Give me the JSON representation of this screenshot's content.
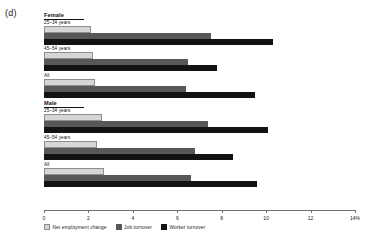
{
  "panel": {
    "letter": "(d)"
  },
  "chart_data": {
    "type": "bar",
    "orientation": "horizontal",
    "title": "",
    "xlabel": "",
    "ylabel": "",
    "xlim": [
      0,
      14
    ],
    "xticks": [
      0,
      2,
      4,
      6,
      8,
      10,
      12,
      14
    ],
    "xtick_labels": [
      "0",
      "2",
      "4",
      "6",
      "8",
      "10",
      "12",
      "14%"
    ],
    "grid": false,
    "legend_position": "bottom-left",
    "series": [
      {
        "name": "Net employment change",
        "color": "#d6d6d6",
        "values": [
          2.1,
          2.2,
          2.3,
          2.6,
          2.4,
          2.7
        ]
      },
      {
        "name": "Job turnover",
        "color": "#585858",
        "values": [
          7.5,
          6.5,
          6.4,
          7.4,
          6.8,
          6.6
        ]
      },
      {
        "name": "Worker turnover",
        "color": "#131313",
        "values": [
          10.3,
          7.8,
          9.5,
          10.1,
          8.5,
          9.6
        ]
      }
    ],
    "categories": [
      "Female 25-34 years",
      "Female 45-54 years",
      "Female All",
      "Male 25-34 years",
      "Male 45-54 years",
      "Male All"
    ],
    "sections": [
      {
        "header": "Female",
        "groups": [
          {
            "label": "25–34 years",
            "net": 2.1,
            "job": 7.5,
            "worker": 10.3
          },
          {
            "label": "45–54 years",
            "net": 2.2,
            "job": 6.5,
            "worker": 7.8
          },
          {
            "label": "All",
            "net": 2.3,
            "job": 6.4,
            "worker": 9.5
          }
        ]
      },
      {
        "header": "Male",
        "groups": [
          {
            "label": "25–34 years",
            "net": 2.6,
            "job": 7.4,
            "worker": 10.1
          },
          {
            "label": "45–54 years",
            "net": 2.4,
            "job": 6.8,
            "worker": 8.5
          },
          {
            "label": "All",
            "net": 2.7,
            "job": 6.6,
            "worker": 9.6
          }
        ]
      }
    ]
  },
  "legend": {
    "items": [
      {
        "key": "net",
        "label": "Net employment change"
      },
      {
        "key": "job",
        "label": "Job turnover"
      },
      {
        "key": "worker",
        "label": "Worker turnover"
      }
    ]
  }
}
